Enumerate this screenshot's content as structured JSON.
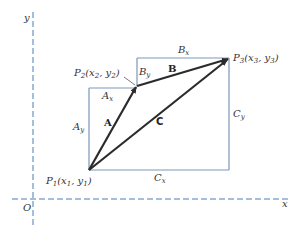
{
  "axes": {
    "x_label": "x",
    "y_label": "y",
    "origin_label": "O",
    "axis_color": "#4a7fb5"
  },
  "points": {
    "p1": {
      "name": "P",
      "sub": "1",
      "coords": "(x",
      "c1": "1",
      "mid": ", y",
      "c2": "1",
      "end": ")"
    },
    "p2": {
      "name": "P",
      "sub": "2",
      "coords": "(x",
      "c1": "2",
      "mid": ", y",
      "c2": "2",
      "end": ")"
    },
    "p3": {
      "name": "P",
      "sub": "3",
      "coords": "(x",
      "c1": "3",
      "mid": ", y",
      "c2": "3",
      "end": ")"
    }
  },
  "vectors": {
    "a": "A",
    "b": "B",
    "c": "C",
    "color": "#2b2b2b"
  },
  "components": {
    "ax": {
      "main": "A",
      "sub": "x"
    },
    "ay": {
      "main": "A",
      "sub": "y"
    },
    "bx": {
      "main": "B",
      "sub": "x"
    },
    "by": {
      "main": "B",
      "sub": "y"
    },
    "cx": {
      "main": "C",
      "sub": "x"
    },
    "cy": {
      "main": "C",
      "sub": "y"
    },
    "box_color": "#7c97b8"
  }
}
